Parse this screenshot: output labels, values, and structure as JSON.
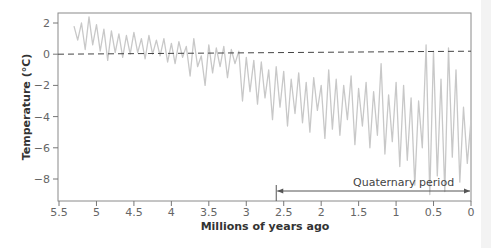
{
  "chart_data": {
    "type": "line",
    "title": "",
    "xlabel": "Millions of years ago",
    "ylabel": "Temperature (°C)",
    "xlim": [
      5.5,
      0
    ],
    "ylim": [
      -9.3,
      2.6
    ],
    "x_ticks": [
      5.5,
      5,
      4.5,
      4,
      3.5,
      3,
      2.5,
      2,
      1.5,
      1,
      0.5,
      0
    ],
    "x_tick_labels": [
      "5.5",
      "5",
      "4.5",
      "4",
      "3.5",
      "3",
      "2.5",
      "2",
      "1.5",
      "1",
      "0.5",
      "0"
    ],
    "y_ticks": [
      2,
      0,
      -2,
      -4,
      -6,
      -8
    ],
    "y_tick_labels": [
      "2",
      "0",
      "−2",
      "−4",
      "−6",
      "−8"
    ],
    "grid": false,
    "legend": null,
    "reference_line": {
      "y": 0,
      "style": "dashed",
      "color": "#444444"
    },
    "annotations": [
      {
        "text": "Quaternary period",
        "x_start": 2.6,
        "x_end": 0,
        "style": "double-arrow"
      }
    ],
    "series": [
      {
        "name": "Temperature anomaly",
        "color": "#c8c8c8",
        "x": [
          5.3,
          5.25,
          5.2,
          5.15,
          5.1,
          5.05,
          5.0,
          4.95,
          4.9,
          4.85,
          4.8,
          4.75,
          4.7,
          4.65,
          4.6,
          4.55,
          4.5,
          4.45,
          4.4,
          4.35,
          4.3,
          4.25,
          4.2,
          4.15,
          4.1,
          4.05,
          4.0,
          3.95,
          3.9,
          3.85,
          3.8,
          3.75,
          3.7,
          3.65,
          3.6,
          3.55,
          3.5,
          3.45,
          3.4,
          3.35,
          3.3,
          3.25,
          3.2,
          3.15,
          3.1,
          3.05,
          3.0,
          2.95,
          2.9,
          2.85,
          2.8,
          2.75,
          2.7,
          2.65,
          2.6,
          2.55,
          2.5,
          2.45,
          2.4,
          2.35,
          2.3,
          2.25,
          2.2,
          2.15,
          2.1,
          2.05,
          2.0,
          1.95,
          1.9,
          1.85,
          1.8,
          1.75,
          1.7,
          1.65,
          1.6,
          1.55,
          1.5,
          1.45,
          1.4,
          1.35,
          1.3,
          1.25,
          1.2,
          1.15,
          1.1,
          1.05,
          1.0,
          0.95,
          0.9,
          0.85,
          0.8,
          0.75,
          0.7,
          0.65,
          0.6,
          0.55,
          0.5,
          0.45,
          0.4,
          0.35,
          0.3,
          0.25,
          0.2,
          0.15,
          0.1,
          0.05,
          0.0
        ],
        "y": [
          1.8,
          0.9,
          2.0,
          0.3,
          2.4,
          0.6,
          1.9,
          0.2,
          1.6,
          -0.4,
          1.5,
          0.1,
          1.3,
          -0.2,
          1.2,
          0.0,
          1.4,
          0.1,
          1.0,
          -0.3,
          1.2,
          0.0,
          0.9,
          -0.1,
          1.0,
          -0.5,
          0.7,
          -0.6,
          0.8,
          -0.2,
          0.5,
          -1.4,
          1.0,
          -0.8,
          -0.1,
          -2.0,
          0.6,
          -1.2,
          0.4,
          -0.8,
          0.5,
          -1.5,
          0.3,
          -0.6,
          0.2,
          -3.0,
          -0.2,
          -2.4,
          -0.4,
          -3.2,
          -0.5,
          -2.8,
          -1.0,
          -4.2,
          -0.8,
          -3.4,
          -1.1,
          -4.6,
          -1.6,
          -3.8,
          -1.2,
          -4.4,
          -1.8,
          -5.0,
          -1.5,
          -3.6,
          -2.0,
          -5.4,
          -1.0,
          -4.8,
          -1.6,
          -5.2,
          -2.0,
          -4.2,
          -1.4,
          -5.8,
          -2.2,
          -4.6,
          -1.8,
          -6.0,
          -2.4,
          -5.2,
          -0.6,
          -6.4,
          -2.6,
          -5.6,
          -1.8,
          -7.2,
          -2.0,
          -6.8,
          -2.8,
          -8.4,
          -3.0,
          -6.0,
          0.6,
          -9.0,
          0.2,
          -7.8,
          -1.6,
          -8.8,
          0.4,
          -6.6,
          -1.0,
          -8.2,
          -3.4,
          -7.0,
          -4.2
        ]
      }
    ]
  }
}
